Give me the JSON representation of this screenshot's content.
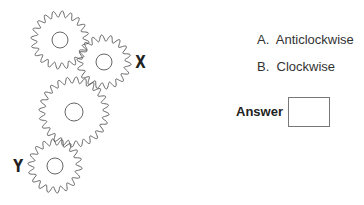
{
  "question": {
    "gears": [
      {
        "id": "gear-1",
        "cx": 60,
        "cy": 40,
        "r": 26,
        "teeth": 20,
        "hub_r": 8,
        "label": ""
      },
      {
        "id": "gear-x",
        "cx": 104,
        "cy": 62,
        "r": 24,
        "teeth": 18,
        "hub_r": 8,
        "label": "X"
      },
      {
        "id": "gear-3",
        "cx": 74,
        "cy": 112,
        "r": 32,
        "teeth": 24,
        "hub_r": 9,
        "label": ""
      },
      {
        "id": "gear-y",
        "cx": 55,
        "cy": 166,
        "r": 24,
        "teeth": 18,
        "hub_r": 8,
        "label": "Y"
      }
    ],
    "labels": {
      "x": "X",
      "y": "Y"
    },
    "options": [
      {
        "letter": "A.",
        "text": "Anticlockwise"
      },
      {
        "letter": "B.",
        "text": "Clockwise"
      }
    ],
    "answer_label": "Answer",
    "answer_value": "",
    "stroke_color": "#555555"
  }
}
